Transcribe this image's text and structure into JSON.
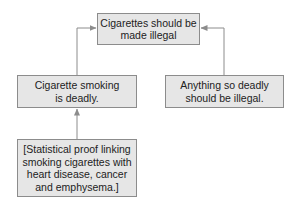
{
  "diagram": {
    "type": "argument-map",
    "colors": {
      "box_fill": "#e6e6e6",
      "box_border": "#8c8c8c",
      "text": "#222222",
      "arrow": "#8c8c8c"
    },
    "nodes": [
      {
        "id": "conclusion",
        "lines": [
          "Cigarettes should be",
          "made illegal"
        ]
      },
      {
        "id": "premise-1",
        "lines": [
          "Cigarette smoking",
          "is deadly."
        ]
      },
      {
        "id": "premise-2",
        "lines": [
          "Anything so deadly",
          "should be illegal."
        ]
      },
      {
        "id": "evidence",
        "lines": [
          "[Statistical proof linking",
          "smoking cigarettes with",
          "heart disease, cancer",
          "and emphysema.]"
        ]
      }
    ],
    "edges": [
      {
        "from": "premise-1",
        "to": "conclusion"
      },
      {
        "from": "premise-2",
        "to": "conclusion"
      },
      {
        "from": "evidence",
        "to": "premise-1"
      }
    ]
  }
}
